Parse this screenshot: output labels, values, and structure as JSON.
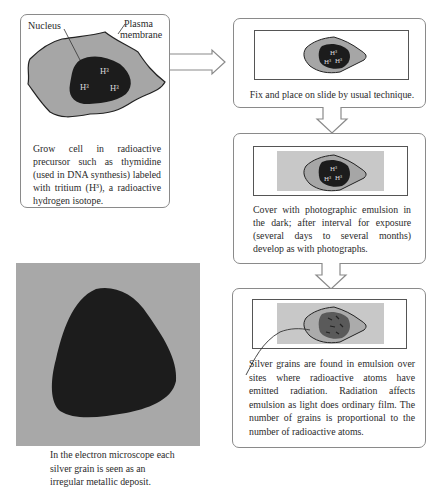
{
  "diagram": {
    "colors": {
      "cytoplasm": "#a6a6a6",
      "nucleus": "#1c1c1c",
      "emulsion": "#c8c8c8",
      "em_background": "#a8a8a8",
      "box_border": "#8a8a8a"
    },
    "step1": {
      "labels": {
        "nucleus": "Nucleus",
        "plasma_membrane_line1": "Plasma",
        "plasma_membrane_line2": "membrane"
      },
      "isotope_marks": [
        "H³",
        "H³",
        "H³"
      ],
      "caption": "Grow cell in radioactive precursor such as thymidine (used in DNA synthesis) labeled with tritium (H³), a radioactive hydrogen isotope."
    },
    "step2": {
      "isotope_marks": [
        "H³",
        "H³",
        "H³"
      ],
      "caption": "Fix and place on slide by usual technique."
    },
    "step3": {
      "isotope_marks": [
        "H³",
        "H³",
        "H³"
      ],
      "caption": "Cover with photographic emulsion in the dark; after interval for exposure (several days to several months) develop as with photographs."
    },
    "step4": {
      "caption": "Silver grains are found in emulsion over sites where radioactive atoms have emitted radiation. Radiation affects emulsion as light does ordinary film. The number of grains is proportional to the number of radioactive atoms."
    },
    "electron_microscope": {
      "caption": "In the electron microscope each silver grain is seen as an irregular metallic deposit."
    }
  }
}
